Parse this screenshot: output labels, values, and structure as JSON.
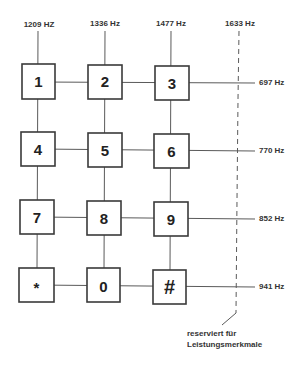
{
  "diagram": {
    "type": "dtmf-keypad-frequency-matrix",
    "column_frequencies": [
      {
        "label": "1209 HZ",
        "x": 39
      },
      {
        "label": "1336 Hz",
        "x": 105
      },
      {
        "label": "1477 Hz",
        "x": 171
      },
      {
        "label": "1633 Hz",
        "x": 239,
        "reserved": true
      }
    ],
    "row_frequencies": [
      {
        "label": "697 Hz",
        "y": 82
      },
      {
        "label": "770 Hz",
        "y": 150
      },
      {
        "label": "852 Hz",
        "y": 218
      },
      {
        "label": "941 Hz",
        "y": 286
      }
    ],
    "keys": [
      [
        "1",
        "2",
        "3"
      ],
      [
        "4",
        "5",
        "6"
      ],
      [
        "7",
        "8",
        "9"
      ],
      [
        "*",
        "0",
        "#"
      ]
    ],
    "reserved_note": {
      "line1": "reserviert für",
      "line2": "Leistungsmerkmale"
    },
    "colors": {
      "line": "#5a5a5a",
      "box_border": "#3a3a3a",
      "text": "#222222",
      "background": "#ffffff"
    }
  }
}
